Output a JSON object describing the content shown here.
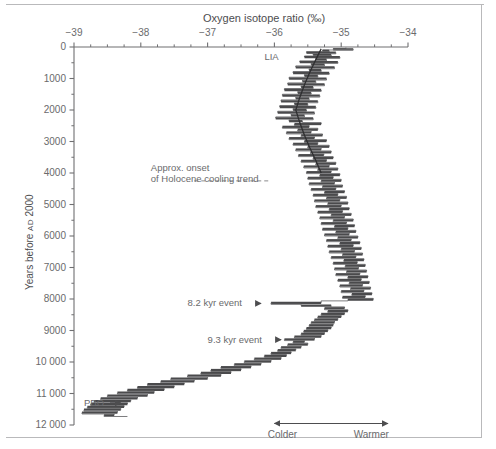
{
  "figure": {
    "title": "Oxygen isotope ratio (‰)",
    "ylabel_main": "Years before ",
    "ylabel_era": "AD",
    "ylabel_year": " 2000"
  },
  "chart_data": {
    "type": "line",
    "title": "Oxygen isotope ratio (‰)",
    "xlabel": "Oxygen isotope ratio (‰)",
    "ylabel": "Years before AD 2000",
    "xlim": [
      -39,
      -34
    ],
    "ylim": [
      12000,
      0
    ],
    "y_inverted": true,
    "grid": false,
    "legend": "none",
    "xticks": [
      -39,
      -38,
      -37,
      -36,
      -35,
      -34
    ],
    "xtick_labels": [
      "−39",
      "−38",
      "−37",
      "−36",
      "−35",
      "−34"
    ],
    "x_minor_ticks": [
      -38.75,
      -38.5,
      -38.25,
      -37.75,
      -37.5,
      -37.25,
      -36.75,
      -36.5,
      -36.25,
      -35.75,
      -35.5,
      -35.25,
      -34.75,
      -34.5,
      -34.25
    ],
    "yticks": [
      0,
      1000,
      2000,
      3000,
      4000,
      5000,
      6000,
      7000,
      8000,
      9000,
      10000,
      11000,
      12000
    ],
    "ytick_labels": [
      "0",
      "1000",
      "2000",
      "3000",
      "4000",
      "5000",
      "6000",
      "7000",
      "8000",
      "9000",
      "10 000",
      "11 000",
      "12 000"
    ],
    "y_minor_ticks": [
      500,
      1500,
      2500,
      3500,
      4500,
      5500,
      6500,
      7500,
      8500,
      9500,
      10500,
      11500
    ],
    "series": [
      {
        "name": "GISP2 δ¹⁸O record",
        "style": "step-noise",
        "color": "#5f5f61",
        "points": [
          [
            -34.93,
            20
          ],
          [
            -35.12,
            55
          ],
          [
            -34.82,
            75
          ],
          [
            -35.28,
            95
          ],
          [
            -35.18,
            120
          ],
          [
            -35.52,
            150
          ],
          [
            -35.08,
            180
          ],
          [
            -35.42,
            215
          ],
          [
            -35.15,
            250
          ],
          [
            -35.55,
            285
          ],
          [
            -35.02,
            320
          ],
          [
            -35.38,
            360
          ],
          [
            -35.22,
            400
          ],
          [
            -35.62,
            440
          ],
          [
            -35.05,
            480
          ],
          [
            -35.45,
            520
          ],
          [
            -35.25,
            560
          ],
          [
            -35.68,
            600
          ],
          [
            -35.1,
            645
          ],
          [
            -35.48,
            690
          ],
          [
            -35.3,
            735
          ],
          [
            -35.72,
            780
          ],
          [
            -35.18,
            825
          ],
          [
            -35.55,
            870
          ],
          [
            -35.35,
            915
          ],
          [
            -35.78,
            960
          ],
          [
            -35.22,
            1005
          ],
          [
            -35.58,
            1050
          ],
          [
            -35.38,
            1095
          ],
          [
            -35.8,
            1140
          ],
          [
            -35.25,
            1185
          ],
          [
            -35.6,
            1230
          ],
          [
            -35.42,
            1275
          ],
          [
            -35.85,
            1320
          ],
          [
            -35.3,
            1365
          ],
          [
            -35.65,
            1410
          ],
          [
            -35.45,
            1455
          ],
          [
            -35.88,
            1500
          ],
          [
            -35.32,
            1545
          ],
          [
            -35.68,
            1590
          ],
          [
            -35.48,
            1635
          ],
          [
            -35.9,
            1680
          ],
          [
            -35.35,
            1725
          ],
          [
            -35.7,
            1770
          ],
          [
            -35.5,
            1815
          ],
          [
            -35.92,
            1860
          ],
          [
            -35.38,
            1905
          ],
          [
            -35.72,
            1950
          ],
          [
            -35.52,
            1995
          ],
          [
            -35.95,
            2040
          ],
          [
            -35.4,
            2085
          ],
          [
            -35.75,
            2130
          ],
          [
            -35.55,
            2175
          ],
          [
            -35.98,
            2220
          ],
          [
            -35.42,
            2265
          ],
          [
            -35.78,
            2310
          ],
          [
            -35.58,
            2355
          ],
          [
            -35.3,
            2400
          ],
          [
            -35.7,
            2445
          ],
          [
            -35.48,
            2490
          ],
          [
            -35.88,
            2535
          ],
          [
            -35.35,
            2580
          ],
          [
            -35.65,
            2625
          ],
          [
            -35.45,
            2670
          ],
          [
            -35.82,
            2715
          ],
          [
            -35.28,
            2760
          ],
          [
            -35.6,
            2805
          ],
          [
            -35.4,
            2850
          ],
          [
            -35.78,
            2895
          ],
          [
            -35.22,
            2940
          ],
          [
            -35.55,
            2985
          ],
          [
            -35.35,
            3030
          ],
          [
            -35.72,
            3075
          ],
          [
            -35.18,
            3120
          ],
          [
            -35.5,
            3165
          ],
          [
            -35.3,
            3210
          ],
          [
            -35.68,
            3255
          ],
          [
            -35.15,
            3300
          ],
          [
            -35.46,
            3345
          ],
          [
            -35.26,
            3390
          ],
          [
            -35.64,
            3435
          ],
          [
            -35.12,
            3480
          ],
          [
            -35.42,
            3525
          ],
          [
            -35.22,
            3570
          ],
          [
            -35.6,
            3615
          ],
          [
            -35.08,
            3660
          ],
          [
            -35.38,
            3705
          ],
          [
            -35.18,
            3750
          ],
          [
            -35.56,
            3795
          ],
          [
            -35.05,
            3840
          ],
          [
            -35.35,
            3885
          ],
          [
            -35.15,
            3930
          ],
          [
            -35.52,
            3975
          ],
          [
            -35.02,
            4020
          ],
          [
            -35.32,
            4065
          ],
          [
            -35.12,
            4110
          ],
          [
            -35.5,
            4155
          ],
          [
            -35.0,
            4200
          ],
          [
            -35.3,
            4245
          ],
          [
            -35.1,
            4290
          ],
          [
            -35.48,
            4335
          ],
          [
            -34.98,
            4380
          ],
          [
            -35.28,
            4425
          ],
          [
            -35.08,
            4470
          ],
          [
            -35.45,
            4515
          ],
          [
            -34.95,
            4560
          ],
          [
            -35.25,
            4605
          ],
          [
            -35.05,
            4650
          ],
          [
            -35.42,
            4695
          ],
          [
            -34.92,
            4740
          ],
          [
            -35.22,
            4785
          ],
          [
            -35.02,
            4830
          ],
          [
            -35.4,
            4875
          ],
          [
            -34.9,
            4920
          ],
          [
            -35.2,
            4965
          ],
          [
            -35.0,
            5010
          ],
          [
            -35.38,
            5055
          ],
          [
            -34.88,
            5100
          ],
          [
            -35.18,
            5145
          ],
          [
            -34.98,
            5190
          ],
          [
            -35.35,
            5235
          ],
          [
            -34.85,
            5280
          ],
          [
            -35.15,
            5325
          ],
          [
            -34.95,
            5370
          ],
          [
            -35.32,
            5415
          ],
          [
            -34.82,
            5460
          ],
          [
            -35.12,
            5505
          ],
          [
            -34.92,
            5550
          ],
          [
            -35.3,
            5595
          ],
          [
            -34.8,
            5640
          ],
          [
            -35.1,
            5685
          ],
          [
            -34.9,
            5730
          ],
          [
            -35.28,
            5775
          ],
          [
            -34.78,
            5820
          ],
          [
            -35.08,
            5865
          ],
          [
            -34.88,
            5910
          ],
          [
            -35.25,
            5955
          ],
          [
            -34.75,
            6000
          ],
          [
            -35.05,
            6045
          ],
          [
            -34.85,
            6090
          ],
          [
            -35.22,
            6135
          ],
          [
            -34.72,
            6180
          ],
          [
            -35.02,
            6225
          ],
          [
            -34.82,
            6270
          ],
          [
            -35.2,
            6315
          ],
          [
            -34.7,
            6360
          ],
          [
            -35.0,
            6405
          ],
          [
            -34.8,
            6450
          ],
          [
            -35.18,
            6495
          ],
          [
            -34.68,
            6540
          ],
          [
            -34.98,
            6585
          ],
          [
            -34.78,
            6630
          ],
          [
            -35.15,
            6675
          ],
          [
            -34.66,
            6720
          ],
          [
            -34.96,
            6765
          ],
          [
            -34.76,
            6810
          ],
          [
            -35.12,
            6855
          ],
          [
            -34.64,
            6900
          ],
          [
            -34.94,
            6945
          ],
          [
            -34.74,
            6990
          ],
          [
            -35.1,
            7035
          ],
          [
            -34.62,
            7080
          ],
          [
            -34.92,
            7125
          ],
          [
            -34.72,
            7170
          ],
          [
            -35.08,
            7215
          ],
          [
            -34.6,
            7260
          ],
          [
            -34.9,
            7305
          ],
          [
            -34.7,
            7350
          ],
          [
            -35.05,
            7395
          ],
          [
            -34.58,
            7440
          ],
          [
            -34.88,
            7485
          ],
          [
            -34.68,
            7530
          ],
          [
            -35.02,
            7575
          ],
          [
            -34.56,
            7620
          ],
          [
            -34.86,
            7665
          ],
          [
            -34.66,
            7710
          ],
          [
            -35.0,
            7755
          ],
          [
            -34.54,
            7800
          ],
          [
            -34.84,
            7845
          ],
          [
            -34.64,
            7890
          ],
          [
            -34.98,
            7935
          ],
          [
            -34.52,
            7980
          ],
          [
            -34.9,
            8020
          ],
          [
            -35.3,
            8060
          ],
          [
            -36.05,
            8120
          ],
          [
            -35.6,
            8170
          ],
          [
            -35.15,
            8210
          ],
          [
            -34.95,
            8250
          ],
          [
            -35.25,
            8295
          ],
          [
            -34.9,
            8340
          ],
          [
            -35.2,
            8385
          ],
          [
            -34.95,
            8430
          ],
          [
            -35.3,
            8475
          ],
          [
            -35.0,
            8520
          ],
          [
            -35.35,
            8565
          ],
          [
            -35.05,
            8610
          ],
          [
            -35.4,
            8655
          ],
          [
            -35.1,
            8700
          ],
          [
            -35.45,
            8745
          ],
          [
            -35.12,
            8790
          ],
          [
            -35.48,
            8835
          ],
          [
            -35.15,
            8880
          ],
          [
            -35.52,
            8925
          ],
          [
            -35.2,
            8970
          ],
          [
            -35.56,
            9015
          ],
          [
            -35.25,
            9060
          ],
          [
            -35.6,
            9105
          ],
          [
            -35.3,
            9150
          ],
          [
            -35.7,
            9195
          ],
          [
            -35.4,
            9240
          ],
          [
            -35.85,
            9285
          ],
          [
            -35.55,
            9320
          ],
          [
            -35.72,
            9360
          ],
          [
            -35.5,
            9400
          ],
          [
            -35.8,
            9445
          ],
          [
            -35.6,
            9490
          ],
          [
            -35.9,
            9535
          ],
          [
            -35.68,
            9580
          ],
          [
            -35.95,
            9625
          ],
          [
            -35.75,
            9670
          ],
          [
            -36.05,
            9715
          ],
          [
            -35.82,
            9760
          ],
          [
            -36.15,
            9805
          ],
          [
            -35.9,
            9850
          ],
          [
            -36.3,
            9895
          ],
          [
            -36.05,
            9940
          ],
          [
            -36.45,
            9985
          ],
          [
            -36.2,
            10030
          ],
          [
            -36.6,
            10075
          ],
          [
            -36.35,
            10120
          ],
          [
            -36.8,
            10165
          ],
          [
            -36.5,
            10210
          ],
          [
            -36.95,
            10255
          ],
          [
            -36.65,
            10300
          ],
          [
            -37.1,
            10345
          ],
          [
            -36.8,
            10390
          ],
          [
            -37.3,
            10435
          ],
          [
            -37.0,
            10480
          ],
          [
            -37.55,
            10525
          ],
          [
            -37.2,
            10570
          ],
          [
            -37.7,
            10615
          ],
          [
            -37.35,
            10660
          ],
          [
            -37.9,
            10705
          ],
          [
            -37.5,
            10750
          ],
          [
            -38.05,
            10795
          ],
          [
            -37.65,
            10840
          ],
          [
            -38.2,
            10885
          ],
          [
            -37.8,
            10930
          ],
          [
            -38.35,
            10975
          ],
          [
            -37.9,
            11020
          ],
          [
            -38.5,
            11065
          ],
          [
            -38.05,
            11110
          ],
          [
            -38.6,
            11155
          ],
          [
            -38.15,
            11200
          ],
          [
            -38.7,
            11245
          ],
          [
            -38.2,
            11290
          ],
          [
            -38.75,
            11335
          ],
          [
            -38.25,
            11380
          ],
          [
            -38.8,
            11425
          ],
          [
            -38.3,
            11470
          ],
          [
            -38.85,
            11515
          ],
          [
            -38.35,
            11560
          ],
          [
            -38.88,
            11605
          ],
          [
            -38.4,
            11650
          ],
          [
            -38.55,
            11695
          ],
          [
            -38.2,
            11730
          ]
        ]
      },
      {
        "name": "Holocene cooling trend line",
        "style": "trend",
        "color": "#2e2e30",
        "points": [
          [
            -35.3,
            60
          ],
          [
            -35.38,
            400
          ],
          [
            -35.47,
            800
          ],
          [
            -35.55,
            1200
          ],
          [
            -35.62,
            1600
          ],
          [
            -35.68,
            2000
          ],
          [
            -35.62,
            2400
          ],
          [
            -35.55,
            2800
          ],
          [
            -35.47,
            3200
          ],
          [
            -35.38,
            3600
          ],
          [
            -35.3,
            4000
          ]
        ]
      }
    ],
    "annotations": [
      {
        "name": "lia",
        "text": "LIA",
        "x": -36.15,
        "y": 330,
        "arrow": false
      },
      {
        "name": "holocene-onset",
        "text_lines": [
          "Approx. onset",
          "of Holocene cooling trend"
        ],
        "x": -37.85,
        "y": 3850,
        "dashed_line": {
          "x_start": -37.2,
          "x_end": -36.05,
          "y": 4250
        }
      },
      {
        "name": "event-8200",
        "text": "8.2 kyr event",
        "x": -37.3,
        "y": 8140,
        "arrow": true,
        "arrow_to_x": -36.2
      },
      {
        "name": "event-9300",
        "text": "9.3 kyr event",
        "x": -37.0,
        "y": 9290,
        "arrow": true,
        "arrow_to_x": -35.9
      },
      {
        "name": "pbo",
        "text": "PBO",
        "x": -38.85,
        "y": 11300,
        "arrow": true,
        "arrow_to_x": -38.3
      }
    ],
    "direction_scale": {
      "left_label": "Colder",
      "right_label": "Warmer",
      "y": 11950
    }
  }
}
